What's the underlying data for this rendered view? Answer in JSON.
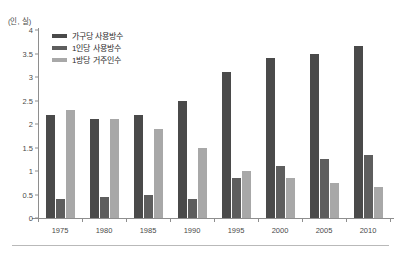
{
  "figure": {
    "top_cut_text": "",
    "y_unit_label": "(인, 실)"
  },
  "legend": {
    "position": "top-left-inside",
    "items": [
      {
        "label": "가구당 사용방수",
        "color": "#4a4a4a"
      },
      {
        "label": "1인당 사용방수",
        "color": "#5e5e5e"
      },
      {
        "label": "1방당 거주인수",
        "color": "#a8a8a8"
      }
    ]
  },
  "chart_data": {
    "type": "bar",
    "title": "",
    "subtitle": "",
    "xlabel": "",
    "ylabel": "(인, 실)",
    "categories": [
      "1975",
      "1980",
      "1985",
      "1990",
      "1995",
      "2000",
      "2005",
      "2010"
    ],
    "series": [
      {
        "name": "가구당 사용방수",
        "color": "#4a4a4a",
        "values": [
          2.2,
          2.1,
          2.2,
          2.5,
          3.1,
          3.4,
          3.5,
          3.65
        ]
      },
      {
        "name": "1인당 사용방수",
        "color": "#5e5e5e",
        "values": [
          0.4,
          0.45,
          0.5,
          0.4,
          0.85,
          1.1,
          1.25,
          1.35
        ]
      },
      {
        "name": "1방당 거주인수",
        "color": "#a8a8a8",
        "values": [
          2.3,
          2.1,
          1.9,
          1.5,
          1.0,
          0.85,
          0.75,
          0.65
        ]
      }
    ],
    "ylim": [
      0,
      4
    ],
    "ytick_step": 0.5,
    "yticks": [
      "0",
      "0.5",
      "1",
      "1.5",
      "2",
      "2.5",
      "3",
      "3.5",
      "4"
    ],
    "grid": false,
    "legend_position": "top-left"
  }
}
